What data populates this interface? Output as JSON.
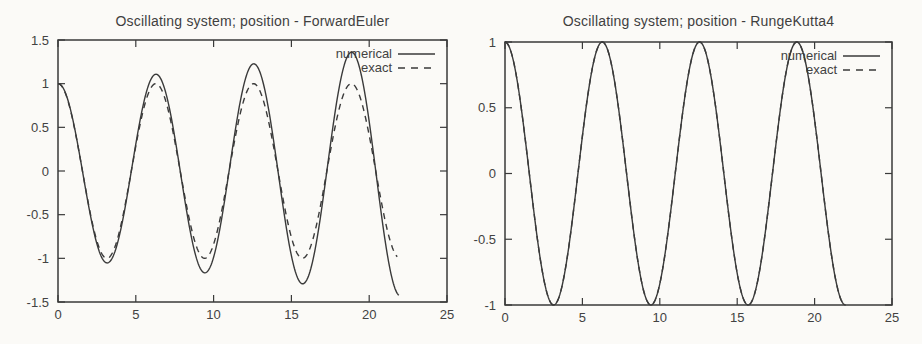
{
  "page": {
    "background_color": "#fbfaf7",
    "line_color": "#3a3a3a",
    "text_color": "#424242"
  },
  "chart_data": [
    {
      "type": "line",
      "title": "Oscillating system; position - ForwardEuler",
      "xlabel": "",
      "ylabel": "",
      "xlim": [
        0,
        25
      ],
      "ylim": [
        -1.5,
        1.5
      ],
      "xticks": [
        0,
        5,
        10,
        15,
        20,
        25
      ],
      "yticks": [
        1.5,
        1,
        0.5,
        0,
        -0.5,
        -1,
        -1.5
      ],
      "grid": false,
      "legend": {
        "position": "top-right-inside",
        "entries": [
          "numerical",
          "exact"
        ]
      },
      "series": [
        {
          "name": "numerical",
          "line_style": "solid",
          "curve": {
            "formula": "y = exp(growth*t) * cos(t)",
            "growth": 0.0163,
            "t_start": 0,
            "t_end": 21.9
          },
          "key_points": [
            [
              0,
              1
            ],
            [
              3.14,
              -1.05
            ],
            [
              6.28,
              1.11
            ],
            [
              9.42,
              -1.16
            ],
            [
              12.57,
              1.22
            ],
            [
              15.71,
              -1.29
            ],
            [
              18.85,
              1.36
            ],
            [
              21.9,
              -1.42
            ]
          ]
        },
        {
          "name": "exact",
          "line_style": "dashed",
          "curve": {
            "formula": "y = exp(growth*t) * cos(t)",
            "growth": 0,
            "t_start": 0,
            "t_end": 21.8
          },
          "key_points": [
            [
              0,
              1
            ],
            [
              3.14,
              -1
            ],
            [
              6.28,
              1
            ],
            [
              9.42,
              -1
            ],
            [
              12.57,
              1
            ],
            [
              15.71,
              -1
            ],
            [
              18.85,
              1
            ],
            [
              21.8,
              -0.95
            ]
          ]
        }
      ]
    },
    {
      "type": "line",
      "title": "Oscillating system; position - RungeKutta4",
      "xlabel": "",
      "ylabel": "",
      "xlim": [
        0,
        25
      ],
      "ylim": [
        -1,
        1
      ],
      "xticks": [
        0,
        5,
        10,
        15,
        20,
        25
      ],
      "yticks": [
        1,
        0.5,
        0,
        -0.5,
        -1
      ],
      "grid": false,
      "legend": {
        "position": "top-right-inside",
        "entries": [
          "numerical",
          "exact"
        ]
      },
      "series": [
        {
          "name": "numerical",
          "line_style": "solid",
          "curve": {
            "formula": "y = exp(growth*t) * cos(t)",
            "growth": 0,
            "t_start": 0,
            "t_end": 22
          },
          "key_points": [
            [
              0,
              1
            ],
            [
              3.14,
              -1
            ],
            [
              6.28,
              1
            ],
            [
              9.42,
              -1
            ],
            [
              12.57,
              1
            ],
            [
              15.71,
              -1
            ],
            [
              18.85,
              1
            ],
            [
              22,
              -1
            ]
          ]
        },
        {
          "name": "exact",
          "line_style": "dashed",
          "curve": {
            "formula": "y = exp(growth*t) * cos(t)",
            "growth": 0,
            "t_start": 0,
            "t_end": 22,
            "note": "overlaps numerical curve exactly"
          },
          "key_points": [
            [
              0,
              1
            ],
            [
              3.14,
              -1
            ],
            [
              6.28,
              1
            ],
            [
              9.42,
              -1
            ],
            [
              12.57,
              1
            ],
            [
              15.71,
              -1
            ],
            [
              18.85,
              1
            ],
            [
              22,
              -1
            ]
          ]
        }
      ]
    }
  ]
}
